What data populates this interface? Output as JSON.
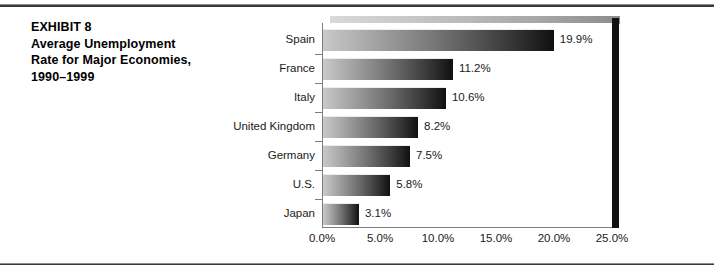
{
  "exhibit": {
    "caption_lines": [
      "EXHIBIT 8",
      "Average Unemployment",
      "Rate for Major Economies,",
      "1990–1999"
    ]
  },
  "chart_data": {
    "type": "bar",
    "orientation": "horizontal",
    "xlabel": "",
    "ylabel": "",
    "categories": [
      "Spain",
      "France",
      "Italy",
      "United Kingdom",
      "Germany",
      "U.S.",
      "Japan"
    ],
    "values": [
      19.9,
      11.2,
      10.6,
      8.2,
      7.5,
      5.8,
      3.1
    ],
    "data_labels": [
      "19.9%",
      "11.2%",
      "10.6%",
      "8.2%",
      "7.5%",
      "5.8%",
      "3.1%"
    ],
    "xlim": [
      0,
      25
    ],
    "xticks": [
      0,
      5,
      10,
      15,
      20,
      25
    ],
    "xtick_labels": [
      "0.0%",
      "5.0%",
      "10.0%",
      "15.0%",
      "20.0%",
      "25.0%"
    ],
    "grid": false,
    "legend": false,
    "bar_style": "gradient-light-to-dark",
    "colors": {
      "bar_gradient_start": "#c9c9c9",
      "bar_gradient_end": "#101010",
      "axis": "#7d7d7d",
      "text": "#1a1a1a",
      "frame_rule": "#3a3a3a",
      "right_wall": "#111111"
    }
  }
}
